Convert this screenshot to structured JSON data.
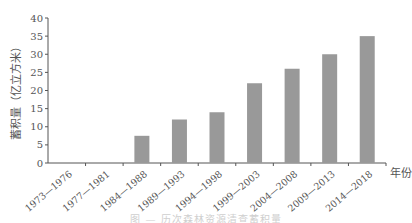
{
  "chart_data": {
    "type": "bar",
    "title": "",
    "xlabel": "年份",
    "ylabel": "蓄积量（亿立方米）",
    "categories": [
      "1973—1976",
      "1977—1981",
      "1984—1988",
      "1989—1993",
      "1994—1998",
      "1999—2003",
      "2004—2008",
      "2009—2013",
      "2014—2018"
    ],
    "values": [
      null,
      null,
      7.5,
      12,
      14,
      22,
      26,
      30,
      35
    ],
    "ylim": [
      0,
      40
    ],
    "yticks": [
      0,
      5,
      10,
      15,
      20,
      25,
      30,
      35,
      40
    ],
    "grid": false,
    "legend": null,
    "bar_color": "#999999"
  },
  "caption": "图 — 历次森林资源清查蓄积量"
}
